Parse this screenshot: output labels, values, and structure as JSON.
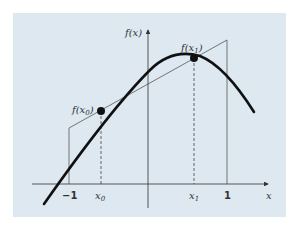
{
  "figure": {
    "background": "#dde8f1",
    "y_axis_label": "f(x)",
    "x_axis_label": "x",
    "tick_labels": {
      "neg_one": "−1",
      "x0": "x0",
      "x1": "x1",
      "one": "1"
    },
    "point_labels": {
      "fx0": "f(x0)",
      "fx1": "f(x1)"
    }
  }
}
